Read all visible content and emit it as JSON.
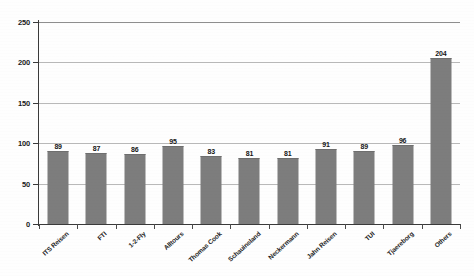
{
  "chart_data": {
    "type": "bar",
    "title": "",
    "subtitle": "",
    "xlabel": "",
    "ylabel": "",
    "ylim": [
      0,
      250
    ],
    "ytick_labels": [
      "0",
      "50",
      "100",
      "150",
      "200",
      "250"
    ],
    "ytick_values": [
      0,
      50,
      100,
      150,
      200,
      250
    ],
    "grid": true,
    "legend": "none",
    "orientation": "vertical",
    "bar_color": "#7d7d7d",
    "axis_color": "#3a3a3a",
    "gridline_color": "#b9b9b9",
    "data_labels": true,
    "categories": [
      "ITS Reisen",
      "FTI",
      "1-2-Fly",
      "Alltours",
      "Thomas Cook",
      "Schauinsland",
      "Neckermann",
      "Jahn Reisen",
      "TUI",
      "Tjaereborg",
      "Others"
    ],
    "values": [
      89,
      87,
      86,
      95,
      83,
      81,
      81,
      91,
      89,
      96,
      204
    ]
  }
}
